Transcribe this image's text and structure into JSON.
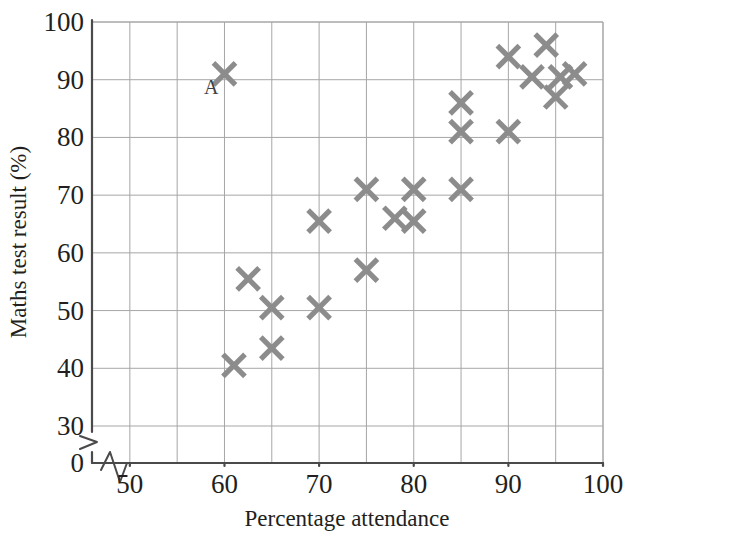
{
  "chart_data": {
    "type": "scatter",
    "title": "",
    "xlabel": "Percentage attendance",
    "ylabel": "Maths test result (%)",
    "xlim": [
      46,
      100
    ],
    "ylim": [
      0,
      100
    ],
    "y_axis_break": true,
    "y_break_between": [
      0,
      30
    ],
    "x_axis_break": true,
    "grid": true,
    "grid_x_step": 5,
    "grid_y_step": 10,
    "xticks": [
      50,
      60,
      70,
      80,
      90,
      100
    ],
    "xtick_labels": [
      "50",
      "60",
      "70",
      "80",
      "90",
      "100"
    ],
    "yticks": [
      0,
      30,
      40,
      50,
      60,
      70,
      80,
      90,
      100
    ],
    "ytick_labels": [
      "0",
      "30",
      "40",
      "50",
      "60",
      "70",
      "80",
      "90",
      "100"
    ],
    "marker_symbol": "x-cross",
    "marker_color": "#8c8c8c",
    "grid_color": "#a6a6a6",
    "axis_color": "#4a4a4a",
    "legend": null,
    "annotations": [
      {
        "text": "A",
        "x": 58.6,
        "y": 87.5,
        "refers_to_point_index": 0
      }
    ],
    "points": [
      {
        "x": 60,
        "y": 91
      },
      {
        "x": 61,
        "y": 40.5
      },
      {
        "x": 62.5,
        "y": 55.5
      },
      {
        "x": 65,
        "y": 50.5
      },
      {
        "x": 65,
        "y": 43.5
      },
      {
        "x": 70,
        "y": 65.5
      },
      {
        "x": 70,
        "y": 50.5
      },
      {
        "x": 75,
        "y": 71
      },
      {
        "x": 75,
        "y": 57
      },
      {
        "x": 78,
        "y": 66
      },
      {
        "x": 80,
        "y": 71
      },
      {
        "x": 80,
        "y": 65.5
      },
      {
        "x": 85,
        "y": 86
      },
      {
        "x": 85,
        "y": 81
      },
      {
        "x": 85,
        "y": 71
      },
      {
        "x": 90,
        "y": 94
      },
      {
        "x": 90,
        "y": 81
      },
      {
        "x": 92.5,
        "y": 90.5
      },
      {
        "x": 94,
        "y": 96
      },
      {
        "x": 95,
        "y": 87
      },
      {
        "x": 95.5,
        "y": 90.5
      },
      {
        "x": 97,
        "y": 91
      }
    ]
  },
  "axes": {
    "x_title": "Percentage attendance",
    "y_title": "Maths test result (%)",
    "x_tick_labels": [
      "50",
      "60",
      "70",
      "80",
      "90",
      "100"
    ],
    "y_tick_labels": [
      "100",
      "90",
      "80",
      "70",
      "60",
      "50",
      "40",
      "30",
      "0"
    ]
  }
}
